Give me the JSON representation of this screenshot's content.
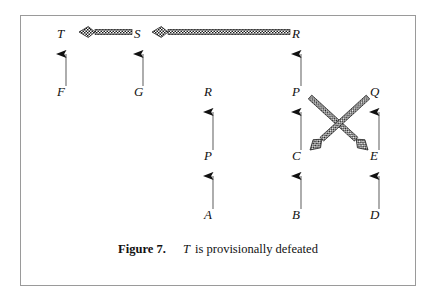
{
  "figure": {
    "caption_number": "Figure 7.",
    "caption_variable": "T",
    "caption_text": "is provisionally defeated",
    "border_color": "#9a9a9a",
    "ink_color": "#111111",
    "background": "#ffffff"
  },
  "nodes": [
    {
      "id": "T",
      "label": "T",
      "x": 62,
      "y": 34
    },
    {
      "id": "S",
      "label": "S",
      "x": 139,
      "y": 34
    },
    {
      "id": "R1",
      "label": "R",
      "x": 297,
      "y": 34
    },
    {
      "id": "F",
      "label": "F",
      "x": 62,
      "y": 92
    },
    {
      "id": "G",
      "label": "G",
      "x": 139,
      "y": 92
    },
    {
      "id": "R2",
      "label": "R",
      "x": 209,
      "y": 92
    },
    {
      "id": "P1",
      "label": "P",
      "x": 297,
      "y": 92
    },
    {
      "id": "Q",
      "label": "Q",
      "x": 375,
      "y": 92
    },
    {
      "id": "P2",
      "label": "P",
      "x": 209,
      "y": 156
    },
    {
      "id": "C",
      "label": "C",
      "x": 297,
      "y": 156
    },
    {
      "id": "E",
      "label": "E",
      "x": 375,
      "y": 156
    },
    {
      "id": "A",
      "label": "A",
      "x": 209,
      "y": 215
    },
    {
      "id": "B",
      "label": "B",
      "x": 297,
      "y": 215
    },
    {
      "id": "D",
      "label": "D",
      "x": 375,
      "y": 215
    }
  ],
  "support_arrows": [
    {
      "from": "F",
      "to": "T",
      "x": 66,
      "y1": 86,
      "y2": 45
    },
    {
      "from": "G",
      "to": "S",
      "x": 143,
      "y1": 86,
      "y2": 45
    },
    {
      "from": "P2",
      "to": "R2",
      "x": 213,
      "y1": 150,
      "y2": 103
    },
    {
      "from": "A",
      "to": "P2",
      "x": 213,
      "y1": 209,
      "y2": 167
    },
    {
      "from": "P1",
      "to": "R1",
      "x": 301,
      "y1": 86,
      "y2": 45
    },
    {
      "from": "C",
      "to": "P1",
      "x": 301,
      "y1": 150,
      "y2": 103
    },
    {
      "from": "B",
      "to": "C",
      "x": 301,
      "y1": 209,
      "y2": 167
    },
    {
      "from": "E",
      "to": "Q",
      "x": 379,
      "y1": 150,
      "y2": 103
    },
    {
      "from": "D",
      "to": "E",
      "x": 379,
      "y1": 209,
      "y2": 167
    }
  ],
  "attack_arrows": [
    {
      "from": "S",
      "to": "T",
      "x1": 132,
      "y1": 32,
      "x2": 79,
      "y2": 32
    },
    {
      "from": "R1",
      "to": "S",
      "x1": 290,
      "y1": 32,
      "x2": 152,
      "y2": 32
    },
    {
      "from": "P1",
      "to": "E",
      "x1": 310,
      "y1": 97,
      "x2": 368,
      "y2": 150
    },
    {
      "from": "Q",
      "to": "C",
      "x1": 368,
      "y1": 97,
      "x2": 310,
      "y2": 150
    }
  ],
  "legend": {
    "support_arrow_name": "plain-support-arrow",
    "attack_arrow_name": "checkered-attack-arrow"
  }
}
